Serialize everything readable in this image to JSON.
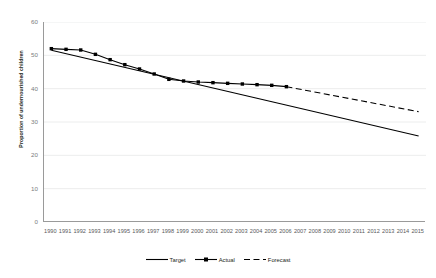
{
  "chart_data": {
    "type": "line",
    "title": "",
    "xlabel": "",
    "ylabel": "Proportion of undernourished children",
    "ylim": [
      0,
      60
    ],
    "ytick_labels": [
      "0",
      "10",
      "20",
      "30",
      "40",
      "50",
      "60"
    ],
    "yticks": [
      0,
      10,
      20,
      30,
      40,
      50,
      60
    ],
    "grid": true,
    "legend_position": "bottom-center",
    "x": [
      1990,
      1991,
      1992,
      1993,
      1994,
      1995,
      1996,
      1997,
      1998,
      1999,
      2000,
      2001,
      2002,
      2003,
      2004,
      2005,
      2006,
      2007,
      2008,
      2009,
      2010,
      2011,
      2012,
      2013,
      2014,
      2015
    ],
    "xtick_labels": [
      "1990",
      "1991",
      "1992",
      "1993",
      "1994",
      "1995",
      "1996",
      "1997",
      "1998",
      "1999",
      "2000",
      "2001",
      "2002",
      "2003",
      "2004",
      "2005",
      "2006",
      "2007",
      "2008",
      "2009",
      "2010",
      "2011",
      "2012",
      "2013",
      "2014",
      "2015"
    ],
    "series": [
      {
        "name": "Target",
        "style": "solid",
        "marker": "none",
        "color": "#000000",
        "x": [
          1990,
          2015
        ],
        "values": [
          51.5,
          25.8
        ]
      },
      {
        "name": "Actual",
        "style": "solid",
        "marker": "square",
        "color": "#000000",
        "x": [
          1990,
          1991,
          1992,
          1993,
          1994,
          1995,
          1996,
          1997,
          1998,
          1999,
          2000,
          2001,
          2002,
          2003,
          2004,
          2005,
          2006
        ],
        "values": [
          52.0,
          51.8,
          51.6,
          50.3,
          48.7,
          47.2,
          45.9,
          44.4,
          42.8,
          42.3,
          42.0,
          41.8,
          41.6,
          41.4,
          41.2,
          41.0,
          40.6
        ]
      },
      {
        "name": "Forecast",
        "style": "dashed",
        "marker": "none",
        "color": "#000000",
        "x": [
          2006,
          2015
        ],
        "values": [
          40.6,
          33.1
        ]
      }
    ]
  },
  "legend": {
    "items": [
      {
        "label": "Target",
        "style": "solid",
        "marker": "none"
      },
      {
        "label": "Actual",
        "style": "solid",
        "marker": "square"
      },
      {
        "label": "Forecast",
        "style": "dashed",
        "marker": "none"
      }
    ]
  },
  "axes": {
    "y_title": "Proportion of undernourished children"
  }
}
